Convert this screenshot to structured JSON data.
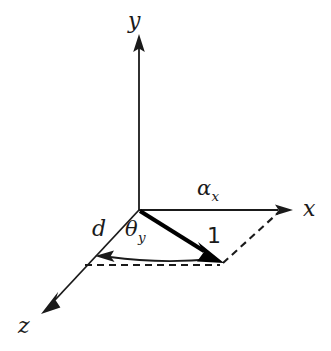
{
  "figure": {
    "background_color": "#ffffff",
    "stroke_color": "#1a1a1a",
    "vector_color": "#000000",
    "axes": [
      {
        "id": "y",
        "label": "y",
        "direction": "up",
        "origin": [
          139,
          210
        ],
        "tip": [
          139,
          36
        ]
      },
      {
        "id": "x",
        "label": "x",
        "direction": "right",
        "origin": [
          139,
          210
        ],
        "tip": [
          292,
          210
        ]
      },
      {
        "id": "z",
        "label": "z",
        "direction": "down-left",
        "origin": [
          139,
          210
        ],
        "tip": [
          42,
          314
        ]
      }
    ],
    "labels": {
      "y_axis": "y",
      "x_axis": "x",
      "z_axis": "z",
      "alpha_base": "α",
      "alpha_sub": "x",
      "theta_base": "θ",
      "theta_sub": "y",
      "distance": "d",
      "vector_magnitude": "1"
    },
    "vector": {
      "name": "unit-vector",
      "label": "1",
      "from": [
        139,
        210
      ],
      "to": [
        222,
        262
      ],
      "style": "bold-solid-arrow"
    },
    "angle_arc": {
      "name": "theta-y-arc",
      "label_base": "θ",
      "label_sub": "y",
      "from_point": [
        215,
        258
      ],
      "to_point": [
        97,
        257
      ],
      "arrow_end": "z-axis"
    },
    "dashed_lines": [
      {
        "name": "projection-horizontal",
        "from": [
          85,
          265
        ],
        "to": [
          222,
          265
        ]
      },
      {
        "name": "projection-to-x-axis",
        "from": [
          222,
          263
        ],
        "to": [
          278,
          211
        ]
      }
    ]
  }
}
